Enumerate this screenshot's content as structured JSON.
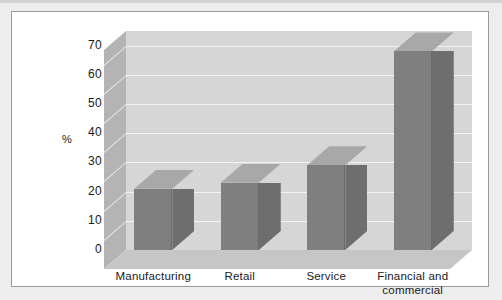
{
  "chart_data": {
    "type": "bar",
    "title": "",
    "subtitle": "",
    "xlabel": "",
    "ylabel": "%",
    "categories": [
      "Manufacturing",
      "Retail",
      "Service",
      "Financial and commercial"
    ],
    "category_lines": [
      [
        "Manufacturing"
      ],
      [
        "Retail"
      ],
      [
        "Service"
      ],
      [
        "Financial and",
        "commercial"
      ]
    ],
    "values": [
      21,
      23,
      29,
      68
    ],
    "ylim": [
      0,
      75
    ],
    "yticks": [
      0,
      10,
      20,
      30,
      40,
      50,
      60,
      70
    ],
    "ytick_labels": [
      "0",
      "10",
      "20",
      "30",
      "40",
      "50",
      "60",
      "70"
    ],
    "grid": true,
    "legend": "none",
    "style": "3d-column",
    "colors": {
      "bar_front": "#7f7f7f",
      "bar_side": "#6e6e6e",
      "bar_top": "#a8a8a8",
      "back_wall": "#d6d6d6",
      "left_wall": "#b4b4b4",
      "floor": "#c6c6c6",
      "gridline": "#f2f2f2",
      "frame_border": "#9a9a9a",
      "page_background": "#ededed",
      "plot_background": "#ffffff",
      "text": "#1a1a1a"
    }
  }
}
